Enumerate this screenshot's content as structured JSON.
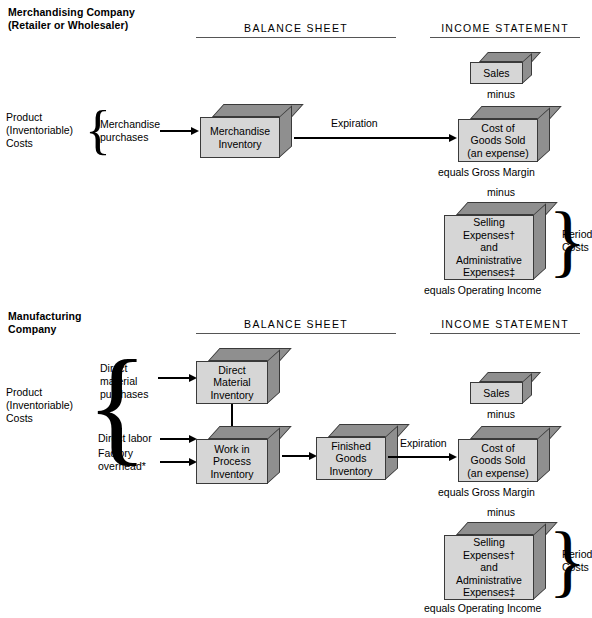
{
  "sections": [
    {
      "id": "merchandising",
      "title_line1": "Merchandising Company",
      "title_line2": "(Retailer or Wholesaler)",
      "headers": {
        "balance_sheet": "BALANCE SHEET",
        "income_statement": "INCOME STATEMENT"
      },
      "cost_group_label_line1": "Product",
      "cost_group_label_line2": "(Inventoriable)",
      "cost_group_label_line3": "Costs",
      "inputs": [
        {
          "line1": "Merchandise",
          "line2": "purchases"
        }
      ],
      "boxes": [
        {
          "name": "merchandise-inventory",
          "text": "Merchandise\nInventory"
        },
        {
          "name": "sales",
          "text": "Sales"
        },
        {
          "name": "cost-of-goods-sold",
          "text": "Cost of\nGoods Sold\n(an expense)"
        },
        {
          "name": "selling-administrative-expenses",
          "text": "Selling\nExpenses†\nand\nAdministrative\nExpenses‡"
        }
      ],
      "flow_label": "Expiration",
      "minus_1": "minus",
      "minus_2": "minus",
      "equals_gross_margin": "equals Gross Margin",
      "equals_operating_income": "equals Operating Income",
      "period_costs_line1": "Period",
      "period_costs_line2": "Costs"
    },
    {
      "id": "manufacturing",
      "title_line1": "Manufacturing",
      "title_line2": "Company",
      "headers": {
        "balance_sheet": "BALANCE SHEET",
        "income_statement": "INCOME STATEMENT"
      },
      "cost_group_label_line1": "Product",
      "cost_group_label_line2": "(Inventoriable)",
      "cost_group_label_line3": "Costs",
      "inputs": [
        {
          "line1": "Direct",
          "line2": "material",
          "line3": "purchases"
        },
        {
          "line1": "Direct labor"
        },
        {
          "line1": "Factory",
          "line2": "overhead*"
        }
      ],
      "boxes": [
        {
          "name": "direct-material-inventory",
          "text": "Direct\nMaterial\nInventory"
        },
        {
          "name": "work-in-process-inventory",
          "text": "Work in\nProcess\nInventory"
        },
        {
          "name": "finished-goods-inventory",
          "text": "Finished\nGoods\nInventory"
        },
        {
          "name": "sales",
          "text": "Sales"
        },
        {
          "name": "cost-of-goods-sold",
          "text": "Cost of\nGoods Sold\n(an expense)"
        },
        {
          "name": "selling-administrative-expenses",
          "text": "Selling\nExpenses†\nand\nAdministrative\nExpenses‡"
        }
      ],
      "flow_label": "Expiration",
      "minus_1": "minus",
      "minus_2": "minus",
      "equals_gross_margin": "equals Gross Margin",
      "equals_operating_income": "equals Operating Income",
      "period_costs_line1": "Period",
      "period_costs_line2": "Costs"
    }
  ],
  "colors": {
    "box_front": "#d6d6d6",
    "box_shade": "#8f8f8f",
    "box_outline": "#3a3a3a",
    "arrow": "#000000",
    "rule": "#555555"
  }
}
